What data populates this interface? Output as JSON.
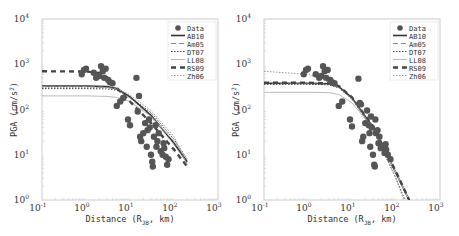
{
  "chart_data": [
    {
      "type": "scatter",
      "title": "",
      "xlabel": "Distance (R_JB, km)",
      "ylabel": "PGA (cm/s^2)",
      "xscale": "log",
      "yscale": "log",
      "xlim": [
        0.1,
        1000
      ],
      "ylim": [
        1,
        10000
      ],
      "x_ticks": [
        "10^-1",
        "10^0",
        "10^1",
        "10^2",
        "10^3"
      ],
      "y_ticks": [
        "10^0",
        "10^1",
        "10^2",
        "10^3",
        "10^4"
      ],
      "grid": false,
      "legend_position": "upper right",
      "legend": [
        "Data",
        "AB10",
        "Am05",
        "DT07",
        "LL08",
        "RS09",
        "Zh06"
      ],
      "data_points": [
        [
          0.8,
          600
        ],
        [
          0.9,
          750
        ],
        [
          1.0,
          800
        ],
        [
          1.5,
          650
        ],
        [
          1.7,
          500
        ],
        [
          2.0,
          550
        ],
        [
          2.2,
          900
        ],
        [
          2.4,
          700
        ],
        [
          2.6,
          500
        ],
        [
          2.8,
          800
        ],
        [
          3.2,
          450
        ],
        [
          3.5,
          400
        ],
        [
          4.0,
          380
        ],
        [
          5.0,
          120
        ],
        [
          6.0,
          150
        ],
        [
          7.0,
          180
        ],
        [
          9.0,
          60
        ],
        [
          10,
          45
        ],
        [
          14,
          500
        ],
        [
          15,
          90
        ],
        [
          16,
          200
        ],
        [
          17,
          25
        ],
        [
          18,
          20
        ],
        [
          20,
          30
        ],
        [
          22,
          50
        ],
        [
          24,
          15
        ],
        [
          25,
          35
        ],
        [
          27,
          60
        ],
        [
          28,
          40
        ],
        [
          30,
          10
        ],
        [
          32,
          7
        ],
        [
          33,
          5.5
        ],
        [
          35,
          25
        ],
        [
          38,
          45
        ],
        [
          40,
          15
        ],
        [
          42,
          20
        ],
        [
          45,
          30
        ],
        [
          50,
          12
        ],
        [
          55,
          10
        ],
        [
          58,
          18
        ],
        [
          60,
          14
        ],
        [
          65,
          9
        ],
        [
          70,
          6
        ],
        [
          75,
          8
        ]
      ],
      "series": [
        {
          "name": "AB10",
          "style": "solid-dark",
          "x": [
            0.1,
            1,
            3,
            5,
            10,
            30,
            100,
            200
          ],
          "values": [
            330,
            330,
            320,
            290,
            190,
            75,
            18,
            7
          ]
        },
        {
          "name": "Am05",
          "style": "dash-light",
          "x": [
            0.1,
            1,
            3,
            5,
            10,
            30,
            100,
            200
          ],
          "values": [
            320,
            320,
            310,
            280,
            180,
            70,
            17,
            6.5
          ]
        },
        {
          "name": "DT07",
          "style": "dotted",
          "x": [
            0.1,
            1,
            3,
            5,
            10,
            30,
            100,
            200
          ],
          "values": [
            290,
            290,
            285,
            265,
            190,
            85,
            22,
            8
          ]
        },
        {
          "name": "LL08",
          "style": "solid-light",
          "x": [
            0.1,
            1,
            3,
            5,
            10,
            30,
            100,
            200
          ],
          "values": [
            200,
            200,
            195,
            185,
            150,
            70,
            20,
            8
          ]
        },
        {
          "name": "RS09",
          "style": "dash-bold",
          "x": [
            0.1,
            1,
            2,
            3,
            5,
            10,
            30,
            100,
            200
          ],
          "values": [
            700,
            690,
            640,
            520,
            300,
            150,
            50,
            13,
            5.5
          ]
        },
        {
          "name": "Zh06",
          "style": "dotted-light",
          "x": [
            0.1,
            1,
            3,
            5,
            10,
            30,
            100,
            200
          ],
          "values": [
            310,
            310,
            305,
            290,
            210,
            95,
            25,
            6
          ]
        }
      ]
    },
    {
      "type": "scatter",
      "title": "",
      "xlabel": "Distance (R_JB, km)",
      "ylabel": "PGA (cm/s^2)",
      "xscale": "log",
      "yscale": "log",
      "xlim": [
        0.1,
        1000
      ],
      "ylim": [
        1,
        10000
      ],
      "x_ticks": [
        "10^-1",
        "10^0",
        "10^1",
        "10^2",
        "10^3"
      ],
      "y_ticks": [
        "10^0",
        "10^1",
        "10^2",
        "10^3",
        "10^4"
      ],
      "grid": false,
      "legend_position": "upper right",
      "legend": [
        "Data",
        "AB10",
        "Am05",
        "DT07",
        "LL08",
        "RS09",
        "Zh06"
      ],
      "data_points": [
        [
          0.8,
          600
        ],
        [
          0.9,
          750
        ],
        [
          1.0,
          800
        ],
        [
          1.5,
          600
        ],
        [
          1.8,
          500
        ],
        [
          2.0,
          550
        ],
        [
          2.2,
          900
        ],
        [
          2.4,
          700
        ],
        [
          2.6,
          500
        ],
        [
          2.8,
          750
        ],
        [
          3.2,
          450
        ],
        [
          3.5,
          400
        ],
        [
          4.0,
          380
        ],
        [
          5.0,
          120
        ],
        [
          6.0,
          150
        ],
        [
          9.0,
          60
        ],
        [
          10,
          42
        ],
        [
          14,
          480
        ],
        [
          15,
          140
        ],
        [
          16,
          130
        ],
        [
          17,
          20
        ],
        [
          18,
          25
        ],
        [
          20,
          50
        ],
        [
          22,
          95
        ],
        [
          24,
          45
        ],
        [
          25,
          30
        ],
        [
          26,
          15
        ],
        [
          27,
          70
        ],
        [
          28,
          40
        ],
        [
          30,
          10
        ],
        [
          32,
          6
        ],
        [
          33,
          5.5
        ],
        [
          34,
          60
        ],
        [
          35,
          30
        ],
        [
          38,
          35
        ],
        [
          40,
          18
        ],
        [
          42,
          25
        ],
        [
          45,
          14
        ],
        [
          50,
          15
        ],
        [
          55,
          11
        ],
        [
          58,
          17
        ],
        [
          60,
          13
        ],
        [
          65,
          10
        ],
        [
          75,
          8
        ]
      ],
      "series": [
        {
          "name": "AB10",
          "style": "solid-dark",
          "x": [
            0.1,
            1,
            3,
            5,
            10,
            30,
            100,
            200
          ],
          "values": [
            380,
            380,
            370,
            320,
            180,
            40,
            4,
            1.0
          ]
        },
        {
          "name": "Am05",
          "style": "dash-light",
          "x": [
            0.1,
            1,
            3,
            5,
            10,
            30,
            100,
            200
          ],
          "values": [
            370,
            370,
            360,
            310,
            175,
            38,
            3.8,
            0.95
          ]
        },
        {
          "name": "DT07",
          "style": "dotted",
          "x": [
            0.1,
            1,
            3,
            5,
            10,
            30,
            100,
            160
          ],
          "values": [
            360,
            360,
            350,
            300,
            170,
            36,
            3,
            1.0
          ]
        },
        {
          "name": "LL08",
          "style": "solid-light",
          "x": [
            0.1,
            1,
            3,
            5,
            10,
            30,
            100,
            200
          ],
          "values": [
            240,
            240,
            235,
            215,
            140,
            38,
            4,
            1.0
          ]
        },
        {
          "name": "RS09",
          "style": "dash-bold",
          "x": [
            0.1,
            1,
            3,
            5,
            10,
            30,
            100,
            200
          ],
          "values": [
            390,
            390,
            380,
            330,
            185,
            42,
            4.2,
            1.0
          ]
        },
        {
          "name": "Zh06",
          "style": "dotted-light",
          "x": [
            0.1,
            1,
            2,
            3,
            5,
            10,
            30,
            100,
            150
          ],
          "values": [
            700,
            600,
            480,
            400,
            300,
            170,
            38,
            3,
            1.0
          ]
        }
      ]
    }
  ],
  "panels": [
    {
      "xlabel_text": "Distance (R",
      "xlabel_sub": "JB",
      "xlabel_tail": ", km)",
      "ylabel_text": "PGA (cm/s",
      "ylabel_sup": "2",
      "ylabel_tail": ")",
      "legend": [
        "Data",
        "AB10",
        "Am05",
        "DT07",
        "LL08",
        "RS09",
        "Zh06"
      ]
    },
    {
      "xlabel_text": "Distance (R",
      "xlabel_sub": "JB",
      "xlabel_tail": ", km)",
      "ylabel_text": "PGA (cm/s",
      "ylabel_sup": "2",
      "ylabel_tail": ")",
      "legend": [
        "Data",
        "AB10",
        "Am05",
        "DT07",
        "LL08",
        "RS09",
        "Zh06"
      ]
    }
  ],
  "ticks": {
    "base": "10",
    "x_exp": [
      "-1",
      "0",
      "1",
      "2",
      "3"
    ],
    "y_exp": [
      "0",
      "1",
      "2",
      "3",
      "4"
    ]
  }
}
